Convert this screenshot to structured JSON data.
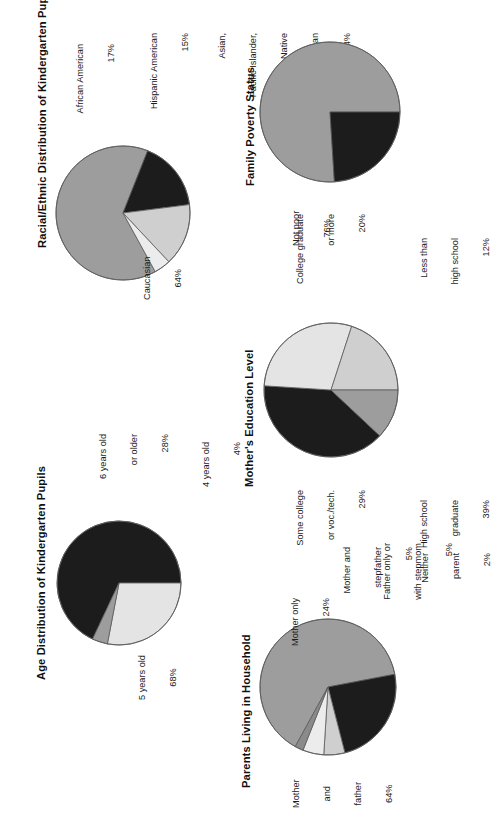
{
  "page": {
    "orientation": "rotated-90-ccw",
    "background": "#ffffff",
    "palette": {
      "black": "#1c1c1c",
      "mid_gray": "#9d9d9d",
      "light_gray": "#cfcfcf",
      "pale_gray": "#e9e9e9",
      "outline": "#5a5a5a"
    }
  },
  "chart_data": [
    {
      "id": "racial-ethnic-distribution",
      "type": "pie",
      "title": "Racial/Ethnic Distribution of Kindergarten Pupils",
      "categories": [
        "Caucasian",
        "African American",
        "Hispanic American",
        "Asian, Pacific Islander, or Native American"
      ],
      "values": [
        64,
        17,
        15,
        4
      ],
      "value_labels": [
        "64%",
        "17%",
        "15%",
        "4%"
      ],
      "unit": "percent",
      "legend": "callout-labels",
      "labels": [
        {
          "lines": [
            "Caucasian",
            "64%"
          ],
          "slice": "Caucasian"
        },
        {
          "lines": [
            "African American",
            "17%"
          ],
          "slice": "African American"
        },
        {
          "lines": [
            "Hispanic American",
            "15%"
          ],
          "slice": "Hispanic American"
        },
        {
          "lines": [
            "Asian,",
            "Pacific Islander,",
            "or Native",
            "American",
            "4%"
          ],
          "slice": "Asian, Pacific Islander, or Native American"
        }
      ],
      "colors": [
        "#9d9d9d",
        "#1c1c1c",
        "#cfcfcf",
        "#ececec"
      ]
    },
    {
      "id": "family-poverty-status",
      "type": "pie",
      "title": "Family Poverty Status",
      "categories": [
        "Not poor",
        "Below poverty"
      ],
      "values": [
        76,
        24
      ],
      "value_labels": [
        "76%",
        "24%"
      ],
      "unit": "percent",
      "legend": "callout-labels",
      "labels": [
        {
          "lines": [
            "Not poor",
            "76%"
          ],
          "slice": "Not poor"
        },
        {
          "lines": [
            "Below",
            "poverty",
            "24%"
          ],
          "slice": "Below poverty"
        }
      ],
      "colors": [
        "#9d9d9d",
        "#1c1c1c"
      ]
    },
    {
      "id": "age-distribution",
      "type": "pie",
      "title": "Age Distribution of Kindergarten Pupils",
      "categories": [
        "5 years old",
        "6 years old or older",
        "4 years old"
      ],
      "values": [
        68,
        28,
        4
      ],
      "value_labels": [
        "68%",
        "28%",
        "4%"
      ],
      "unit": "percent",
      "legend": "callout-labels",
      "labels": [
        {
          "lines": [
            "5 years old",
            "68%"
          ],
          "slice": "5 years old"
        },
        {
          "lines": [
            "6 years old",
            "or older",
            "28%"
          ],
          "slice": "6 years old or older"
        },
        {
          "lines": [
            "4 years old",
            "4%"
          ],
          "slice": "4 years old"
        }
      ],
      "colors": [
        "#1c1c1c",
        "#e4e4e4",
        "#9d9d9d"
      ]
    },
    {
      "id": "mothers-education-level",
      "type": "pie",
      "title": "Mother's Education Level",
      "categories": [
        "High school graduate",
        "Some college or voc./tech.",
        "College graduate or more",
        "Less than high school"
      ],
      "values": [
        39,
        29,
        20,
        12
      ],
      "value_labels": [
        "39%",
        "29%",
        "20%",
        "12%"
      ],
      "unit": "percent",
      "legend": "callout-labels",
      "labels": [
        {
          "lines": [
            "High school",
            "graduate",
            "39%"
          ],
          "slice": "High school graduate"
        },
        {
          "lines": [
            "Some college",
            "or voc./tech.",
            "29%"
          ],
          "slice": "Some college or voc./tech."
        },
        {
          "lines": [
            "College graduate",
            "or more",
            "20%"
          ],
          "slice": "College graduate or more"
        },
        {
          "lines": [
            "Less than",
            "high school",
            "12%"
          ],
          "slice": "Less than high school"
        }
      ],
      "colors": [
        "#1c1c1c",
        "#e4e4e4",
        "#cfcfcf",
        "#9d9d9d"
      ]
    },
    {
      "id": "parents-living-in-household",
      "type": "pie",
      "title": "Parents Living in Household",
      "categories": [
        "Mother and father",
        "Mother only",
        "Mother and stepfather",
        "Father only or with stepmom",
        "Neither parent"
      ],
      "values": [
        64,
        24,
        5,
        5,
        2
      ],
      "value_labels": [
        "64%",
        "24%",
        "5%",
        "5%",
        "2%"
      ],
      "unit": "percent",
      "legend": "callout-labels",
      "labels": [
        {
          "lines": [
            "Mother",
            "and",
            "father",
            "64%"
          ],
          "slice": "Mother and father"
        },
        {
          "lines": [
            "Mother only",
            "24%"
          ],
          "slice": "Mother only"
        },
        {
          "lines": [
            "Mother and",
            "stepfather",
            "5%"
          ],
          "slice": "Mother and stepfather"
        },
        {
          "lines": [
            "Father only or",
            "with stepmom",
            "5%"
          ],
          "slice": "Father only or with stepmom"
        },
        {
          "lines": [
            "Neither",
            "parent",
            "2%"
          ],
          "slice": "Neither parent"
        }
      ],
      "colors": [
        "#9d9d9d",
        "#1c1c1c",
        "#cfcfcf",
        "#ececec",
        "#8a8a8a"
      ]
    }
  ],
  "charts": {
    "c0": {
      "title": "Racial/Ethnic Distribution of Kindergarten Pupils",
      "l_caucasian_a": "Caucasian",
      "l_caucasian_b": "64%",
      "l_african_a": "African American",
      "l_african_b": "17%",
      "l_hispanic_a": "Hispanic American",
      "l_hispanic_b": "15%",
      "l_asian_a": "Asian,",
      "l_asian_b": "Pacific Islander,",
      "l_asian_c": "or Native",
      "l_asian_d": "American",
      "l_asian_e": "4%"
    },
    "c1": {
      "title": "Family Poverty Status",
      "l_notpoor_a": "Not poor",
      "l_notpoor_b": "76%",
      "l_below_a": "Below",
      "l_below_b": "poverty",
      "l_below_c": "24%"
    },
    "c2": {
      "title": "Age Distribution of Kindergarten Pupils",
      "l_five_a": "5 years old",
      "l_five_b": "68%",
      "l_six_a": "6 years old",
      "l_six_b": "or older",
      "l_six_c": "28%",
      "l_four_a": "4 years old",
      "l_four_b": "4%"
    },
    "c3": {
      "title": "Mother's Education Level",
      "l_hs_a": "High school",
      "l_hs_b": "graduate",
      "l_hs_c": "39%",
      "l_some_a": "Some college",
      "l_some_b": "or voc./tech.",
      "l_some_c": "29%",
      "l_coll_a": "College graduate",
      "l_coll_b": "or more",
      "l_coll_c": "20%",
      "l_less_a": "Less than",
      "l_less_b": "high school",
      "l_less_c": "12%"
    },
    "c4": {
      "title": "Parents Living in Household",
      "l_mf_a": "Mother",
      "l_mf_b": "and",
      "l_mf_c": "father",
      "l_mf_d": "64%",
      "l_mo_a": "Mother only",
      "l_mo_b": "24%",
      "l_ms_a": "Mother and",
      "l_ms_b": "stepfather",
      "l_ms_c": "5%",
      "l_fo_a": "Father only or",
      "l_fo_b": "with stepmom",
      "l_fo_c": "5%",
      "l_np_a": "Neither",
      "l_np_b": "parent",
      "l_np_c": "2%"
    }
  }
}
